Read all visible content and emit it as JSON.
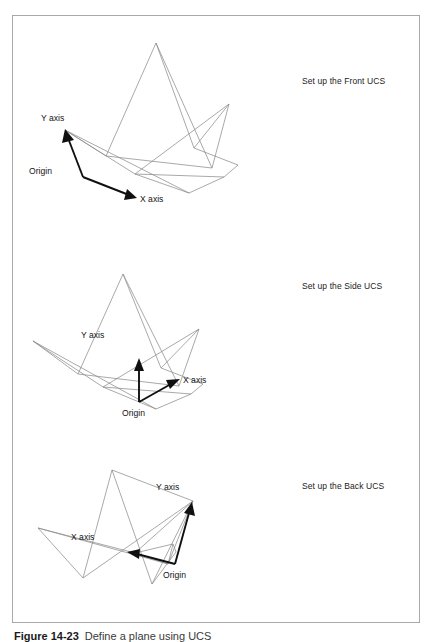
{
  "figure": {
    "caption_number": "Figure 14-23",
    "caption_text": "Define a plane using UCS",
    "border_color": "#a9a9a9",
    "wire_color": "#8c8c8c",
    "axis_color": "#101010",
    "background": "#ffffff"
  },
  "panels": [
    {
      "id": "front",
      "side_label": "Set up the Front UCS",
      "origin_label": "Origin",
      "x_axis_label": "X axis",
      "y_axis_label": "Y axis",
      "orientation": "Front UCS: origin lower-left, Y axis up-left, X axis right-down"
    },
    {
      "id": "side",
      "side_label": "Set up the Side UCS",
      "origin_label": "Origin",
      "x_axis_label": "X axis",
      "y_axis_label": "Y axis",
      "orientation": "Side UCS: origin bottom-center, Y axis straight up, X axis up-right"
    },
    {
      "id": "back",
      "side_label": "Set up the Back UCS",
      "origin_label": "Origin",
      "x_axis_label": "X axis",
      "y_axis_label": "Y axis",
      "orientation": "Back UCS: origin lower-right, Y axis up-right, X axis to the left"
    }
  ]
}
